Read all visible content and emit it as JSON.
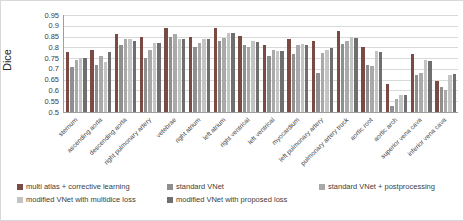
{
  "chart_data": {
    "type": "bar",
    "title": "",
    "xlabel": "",
    "ylabel": "Dice",
    "ylim": [
      0.5,
      0.95
    ],
    "grid": true,
    "legend_position": "bottom",
    "yticks": [
      "0.95",
      "0.9",
      "0.85",
      "0.8",
      "0.75",
      "0.7",
      "0.65",
      "0.6",
      "0.55",
      "0.5"
    ],
    "categories": [
      "sternum",
      "ascending aorta",
      "descending aorta",
      "right pulmonary artery",
      "vetebrae",
      "right atrium",
      "left atrium",
      "right ventrical",
      "left ventrical",
      "myocardium",
      "left pulmonary artery",
      "pulmonary artery truck",
      "aortic root",
      "aortic arch",
      "superior vena cava",
      "inferior vena cava"
    ],
    "series": [
      {
        "name": "multi atlas + corrective learning",
        "color": "#7a4a44",
        "values": [
          0.78,
          0.79,
          0.86,
          0.85,
          0.89,
          0.85,
          0.89,
          0.855,
          0.81,
          0.84,
          0.83,
          0.875,
          0.8,
          0.63,
          0.77,
          0.645
        ]
      },
      {
        "name": "standard VNet",
        "color": "#8f8f8f",
        "values": [
          0.71,
          0.72,
          0.81,
          0.75,
          0.85,
          0.8,
          0.83,
          0.81,
          0.76,
          0.77,
          0.68,
          0.815,
          0.72,
          0.53,
          0.67,
          0.615
        ]
      },
      {
        "name": "standard VNet + postprocessing",
        "color": "#a9a9a9",
        "values": [
          0.74,
          0.76,
          0.84,
          0.79,
          0.86,
          0.82,
          0.845,
          0.8,
          0.79,
          0.81,
          0.775,
          0.83,
          0.715,
          0.56,
          0.68,
          0.6
        ]
      },
      {
        "name": "modified VNet with multidice loss",
        "color": "#c4c4c4",
        "values": [
          0.75,
          0.73,
          0.84,
          0.82,
          0.84,
          0.84,
          0.865,
          0.83,
          0.785,
          0.815,
          0.79,
          0.85,
          0.785,
          0.58,
          0.74,
          0.67
        ]
      },
      {
        "name": "modified VNet with proposed loss",
        "color": "#6f6f6f",
        "values": [
          0.75,
          0.78,
          0.83,
          0.82,
          0.84,
          0.84,
          0.865,
          0.825,
          0.785,
          0.81,
          0.795,
          0.845,
          0.78,
          0.58,
          0.735,
          0.675
        ]
      }
    ]
  }
}
